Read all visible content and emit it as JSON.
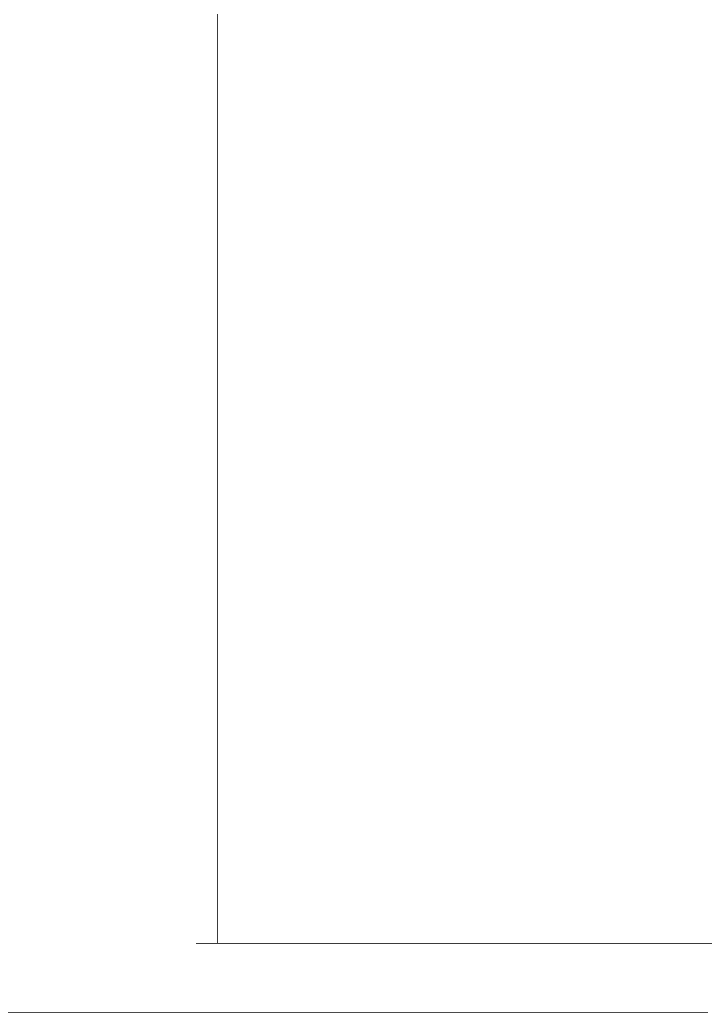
{
  "chart_data": {
    "type": "bar",
    "orientation": "horizontal",
    "title": "",
    "xlabel": "Protección de los derechos procesales penales",
    "ylabel": "",
    "xlim": [
      0,
      1
    ],
    "xticks": [
      0,
      0.2,
      0.4,
      0.6,
      0.8,
      1
    ],
    "xtick_labels": [
      "0",
      ".2",
      ".4",
      ".6",
      ".8",
      "1"
    ],
    "grid": false,
    "legend": null,
    "bar_color": "#8c8c8c",
    "categories": [
      "1950",
      "1975",
      "1990",
      "2000",
      "2010"
    ],
    "groups": [
      {
        "label_lines": [
          "América Latina"
        ],
        "years": [
          "1950",
          "1975",
          "1990",
          "2000",
          "2010"
        ],
        "values": [
          0.314,
          0.398,
          0.477,
          0.509,
          0.536
        ]
      },
      {
        "label_lines": [
          "Oeste de Europa/",
          "Estados Unidos/",
          "Canadá"
        ],
        "years": [
          "1950",
          "1975",
          "1990",
          "2000",
          "2010"
        ],
        "values": [
          0.239,
          0.307,
          0.339,
          0.368,
          0.359
        ]
      },
      {
        "label_lines": [
          "Este de Europa/",
          "Post-Unión",
          "Soviética"
        ],
        "years": [
          "1950",
          "1975",
          "1990",
          "2000",
          "2010"
        ],
        "values": [
          0.211,
          0.259,
          0.218,
          0.455,
          0.486
        ]
      },
      {
        "label_lines": [
          "África",
          "Subsahariana"
        ],
        "years": [
          "1950",
          "1975",
          "1990",
          "2000",
          "2010"
        ],
        "values": [
          0.361,
          0.295,
          0.295,
          0.382,
          0.405
        ]
      },
      {
        "label_lines": [
          "Medio Oriente/",
          "Norte de África"
        ],
        "years": [
          "1950",
          "1975",
          "1990",
          "2000",
          "2010"
        ],
        "values": [
          0.139,
          0.164,
          0.189,
          0.209,
          0.239
        ]
      },
      {
        "label_lines": [
          "Sur de Asia"
        ],
        "years": [
          "1950",
          "1975",
          "1990",
          "2000",
          "2010"
        ],
        "values": [
          0.218,
          0.245,
          0.298,
          0.307,
          0.468
        ]
      },
      {
        "label_lines": [
          "Este de Asia"
        ],
        "years": [
          "1950",
          "1975",
          "1990",
          "2000",
          "2010"
        ],
        "values": [
          0.327,
          0.25,
          0.243,
          0.282,
          0.289
        ]
      }
    ]
  },
  "layout": {
    "x0_px": 218,
    "px_per_unit": 442,
    "row_height_px": 25,
    "group_gap_px": 33,
    "first_row_top_px": 18
  }
}
